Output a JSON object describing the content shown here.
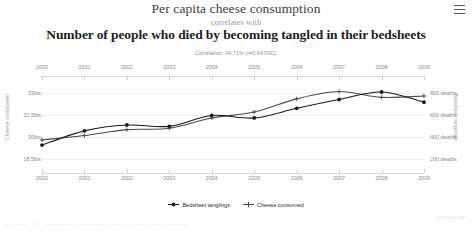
{
  "header": {
    "title_top": "Per capita cheese consumption",
    "connector": "correlates with",
    "title_bottom": "Number of people who died by becoming tangled in their bedsheets",
    "correlation_text": "Correlation: 94.71% (r=0.947091)",
    "menu_icon": "hamburger-menu-icon"
  },
  "legend": {
    "items": [
      {
        "label": "Bedsheet tanglings",
        "color": "#1a1a1a",
        "marker": "filled-circle"
      },
      {
        "label": "Cheese consumed",
        "color": "#4a4a4a",
        "marker": "plus-cross"
      }
    ]
  },
  "footer": {
    "sources": "data sources: U.S. Department of Agriculture and Centers for Disease Control & Prevention",
    "watermark": "tylervigen.com"
  },
  "chart_data": {
    "type": "line",
    "title": "Per capita cheese consumption correlates with Number of people who died by becoming tangled in their bedsheets",
    "xlabel": "",
    "grid": true,
    "legend_position": "bottom",
    "x": [
      2000,
      2001,
      2002,
      2003,
      2004,
      2005,
      2006,
      2007,
      2008,
      2009
    ],
    "categories": [
      "2000",
      "2001",
      "2002",
      "2003",
      "2004",
      "2005",
      "2006",
      "2007",
      "2008",
      "2009"
    ],
    "axes": {
      "left": {
        "label": "Cheese consumed",
        "ticks": [
          "28.5lbs",
          "30lbs",
          "31.5lbs",
          "33lbs"
        ],
        "tick_values": [
          28.5,
          30,
          31.5,
          33
        ],
        "ylim": [
          27.75,
          33.75
        ],
        "unit": "lbs"
      },
      "right": {
        "label": "Bedsheet tanglings",
        "ticks": [
          "200 deaths",
          "400 deaths",
          "600 deaths",
          "800 deaths"
        ],
        "tick_values": [
          200,
          400,
          600,
          800
        ],
        "ylim": [
          100,
          900
        ],
        "unit": "deaths"
      }
    },
    "series": [
      {
        "name": "Cheese consumed",
        "axis": "left",
        "color": "#4a4a4a",
        "marker": "plus-cross",
        "values": [
          29.8,
          30.1,
          30.5,
          30.6,
          31.3,
          31.7,
          32.6,
          33.1,
          32.7,
          32.8
        ]
      },
      {
        "name": "Bedsheet tanglings",
        "axis": "right",
        "color": "#1a1a1a",
        "marker": "filled-circle",
        "values": [
          327,
          456,
          509,
          497,
          596,
          573,
          661,
          741,
          809,
          717
        ]
      }
    ]
  }
}
